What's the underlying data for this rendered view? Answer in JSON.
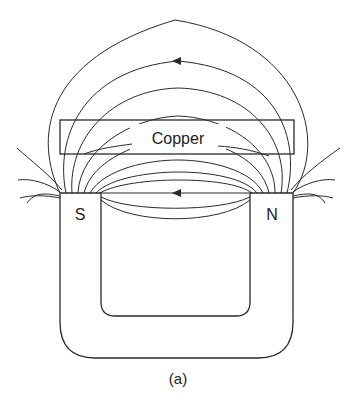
{
  "figure": {
    "caption": "(a)",
    "material_label": "Copper",
    "south_pole_label": "S",
    "north_pole_label": "N",
    "field_direction": "N to S (arrows pointing left)"
  },
  "colors": {
    "stroke": "#2a2a2a",
    "background": "#ffffff"
  }
}
